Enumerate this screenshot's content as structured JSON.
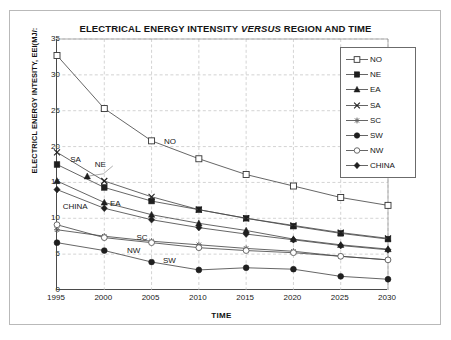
{
  "figure": {
    "title_pre": "ELECTRICAL ENERGY INTENSITY ",
    "title_em": "VERSUS",
    "title_post": " REGION AND TIME",
    "title_full": "ELECTRICAL ENERGY INTENSITY VERSUS REGION AND TIME"
  },
  "axes": {
    "xlabel": "TIME",
    "ylabel": "ELECTRICL ENERGY INTESITY, EEI(MJ/:",
    "yticks": [
      "35",
      "30",
      "25",
      "20",
      "15",
      "10",
      "5",
      "0"
    ],
    "xticks": [
      "1995",
      "2000",
      "2005",
      "2010",
      "2015",
      "2020",
      "2025",
      "2030"
    ]
  },
  "legend": {
    "position": "top-right-inside",
    "entries": [
      {
        "label": "NO",
        "marker": "open-square"
      },
      {
        "label": "NE",
        "marker": "filled-square"
      },
      {
        "label": "EA",
        "marker": "filled-triangle"
      },
      {
        "label": "SA",
        "marker": "x-cross"
      },
      {
        "label": "SC",
        "marker": "asterisk"
      },
      {
        "label": "SW",
        "marker": "filled-circle"
      },
      {
        "label": "NW",
        "marker": "open-circle"
      },
      {
        "label": "CHINA",
        "marker": "filled-diamond"
      }
    ]
  },
  "annotations": [
    {
      "text": "NO",
      "x": 2006.3,
      "y": 20.6
    },
    {
      "text": "SA",
      "x": 1996.4,
      "y": 18.1
    },
    {
      "text": "NE",
      "x": 1999.0,
      "y": 17.4
    },
    {
      "text": "EA",
      "x": 2000.6,
      "y": 12.0
    },
    {
      "text": "CHINA",
      "x": 1995.6,
      "y": 11.6
    },
    {
      "text": "SC",
      "x": 2003.4,
      "y": 7.2
    },
    {
      "text": "NW",
      "x": 2002.4,
      "y": 5.4
    },
    {
      "text": "SW",
      "x": 2006.2,
      "y": 4.1
    }
  ],
  "chart_data": {
    "type": "line",
    "title": "ELECTRICAL ENERGY INTENSITY VERSUS REGION AND TIME",
    "xlabel": "TIME",
    "ylabel": "ELECTRICL ENERGY INTESITY, EEI(MJ/:",
    "x": [
      1995,
      2000,
      2005,
      2010,
      2015,
      2020,
      2025,
      2030
    ],
    "xlim": [
      1995,
      2030
    ],
    "ylim": [
      0,
      35
    ],
    "ytick_step": 5,
    "grid": true,
    "series": [
      {
        "name": "NO",
        "marker": "open-square",
        "values": [
          32.7,
          25.3,
          20.8,
          18.3,
          16.1,
          14.5,
          12.9,
          11.8
        ]
      },
      {
        "name": "NE",
        "marker": "filled-square",
        "values": [
          17.5,
          14.3,
          12.4,
          11.2,
          10.0,
          8.9,
          7.9,
          7.1
        ]
      },
      {
        "name": "EA",
        "marker": "filled-triangle",
        "values": [
          15.2,
          12.2,
          10.5,
          9.3,
          8.3,
          7.1,
          6.3,
          5.7
        ]
      },
      {
        "name": "SA",
        "marker": "x-cross",
        "values": [
          19.2,
          15.2,
          13.0,
          11.2,
          10.0,
          9.0,
          8.0,
          7.2
        ]
      },
      {
        "name": "SC",
        "marker": "asterisk",
        "values": [
          8.4,
          7.5,
          6.8,
          6.3,
          5.8,
          5.4,
          4.7,
          4.2
        ]
      },
      {
        "name": "SW",
        "marker": "filled-circle",
        "values": [
          6.6,
          5.5,
          3.9,
          2.8,
          3.1,
          2.9,
          1.9,
          1.5
        ]
      },
      {
        "name": "NW",
        "marker": "open-circle",
        "values": [
          9.1,
          7.3,
          6.6,
          5.9,
          5.5,
          5.2,
          4.7,
          4.2
        ]
      },
      {
        "name": "CHINA",
        "marker": "filled-diamond",
        "values": [
          14.0,
          11.4,
          9.8,
          8.7,
          7.8,
          7.0,
          6.2,
          5.6
        ]
      }
    ]
  },
  "colors": {
    "line": "#4a4a4a",
    "grid": "#c0c0c0",
    "axis": "#4a4a4a",
    "text": "#141414",
    "background": "#ffffff"
  }
}
